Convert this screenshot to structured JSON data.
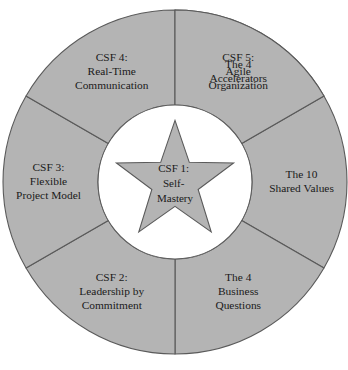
{
  "diagram": {
    "type": "concentric-wheel",
    "colors": {
      "segment_fill": "#b4b4b4",
      "star_fill": "#b4b4b4",
      "hub_fill": "#ffffff",
      "stroke": "#5a5a5a",
      "text": "#1a1a1a",
      "background": "#ffffff"
    },
    "geometry": {
      "center_x": 175,
      "center_y": 182,
      "outer_radius": 172,
      "inner_radius": 77,
      "segment_count": 6,
      "first_divider_angle_deg": 270
    },
    "hub": {
      "label_lines": [
        "CSF 1:",
        "Self-",
        "Mastery"
      ],
      "line1": "CSF 1:",
      "line2": "Self-",
      "line3": "Mastery",
      "shape": "five-pointed-star"
    },
    "segments": [
      {
        "id": "accelerators",
        "position": "top-right",
        "line1": "The 4",
        "line2": "Accelerators",
        "line3": ""
      },
      {
        "id": "shared-values",
        "position": "right",
        "line1": "The 10",
        "line2": "Shared Values",
        "line3": ""
      },
      {
        "id": "business-questions",
        "position": "bottom-right",
        "line1": "The 4",
        "line2": "Business",
        "line3": "Questions"
      },
      {
        "id": "csf-2",
        "position": "bottom",
        "line1": "CSF 2:",
        "line2": "Leadership by",
        "line3": "Commitment"
      },
      {
        "id": "csf-3",
        "position": "bottom-left",
        "line1": "CSF 3:",
        "line2": "Flexible",
        "line3": "Project Model"
      },
      {
        "id": "csf-4",
        "position": "left",
        "line1": "CSF 4:",
        "line2": "Real-Time",
        "line3": "Communication"
      },
      {
        "id": "csf-5",
        "position": "top-left",
        "line1": "CSF 5:",
        "line2": "Agile",
        "line3": "Organization"
      }
    ]
  }
}
